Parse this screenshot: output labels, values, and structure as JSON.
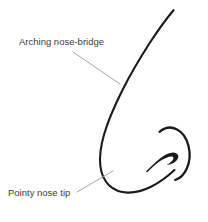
{
  "figure": {
    "name": "nose-profile-diagram",
    "background_color": "#ffffff",
    "ink_color": "#1a1a1a",
    "leader_color": "#9a9a9a",
    "text_color": "#3d3d3d",
    "width": 208,
    "height": 222
  },
  "annotations": [
    {
      "id": "arching-nose-bridge",
      "label": "Arching nose-bridge",
      "text_x": 19,
      "text_y": 45,
      "leader": {
        "x1": 73,
        "y1": 52,
        "x2": 120,
        "y2": 84
      }
    },
    {
      "id": "pointy-nose-tip",
      "label": "Pointy nose tip",
      "text_x": 8,
      "text_y": 196,
      "leader": {
        "x1": 77,
        "y1": 192,
        "x2": 113,
        "y2": 171
      }
    }
  ],
  "drawing": {
    "parts": [
      {
        "id": "nose-outline",
        "name": "nose-bridge-and-tip-outline",
        "stroke_width": 2.1,
        "path": "M173.5,10.2 C166.5,18.5 158.5,29.5 150.0,42.5 C141.0,56.5 131.0,73.0 122.5,90.0 C114.5,106.0 108.0,121.0 104.2,134.0 C100.6,146.5 99.4,157.0 100.3,165.5 C101.2,174.0 104.2,180.5 109.0,185.2 C114.0,190.0 120.5,192.4 127.8,192.6 C135.5,192.8 143.5,190.6 151.0,186.8 C159.5,182.5 167.5,176.5 174.5,170.0"
      },
      {
        "id": "alar-wing",
        "name": "nostril-wing-arc",
        "stroke_width": 2.3,
        "path": "M159.6,131.8 C164.5,127.6 171.0,126.4 176.6,129.2 C182.6,132.2 186.8,138.6 188.6,146.2 C190.4,153.8 189.8,161.8 186.8,168.4 C184.2,174.2 180.0,178.4 175.2,180.0"
      },
      {
        "id": "nostril-crease",
        "name": "nostril-crease-stroke",
        "stroke_width": 1.5,
        "path": "M147.0,171.5 C152.5,166.0 157.5,161.0 162.5,157.6 C167.0,154.6 171.0,153.2 174.2,153.6"
      },
      {
        "id": "nostril-opening",
        "name": "nostril-opening-shape",
        "fill_path": "M151.8,167.2 C156.6,161.6 162.0,157.0 167.0,154.6 C171.4,152.5 175.2,152.2 177.2,154.0 C179.0,155.6 178.6,158.2 176.6,160.4 C174.4,162.8 170.6,164.6 166.8,165.0 C169.6,163.4 172.0,161.4 173.0,159.6 C173.9,158.0 173.4,156.8 171.8,156.6 C169.6,156.3 166.0,157.6 162.2,159.8 C158.4,162.0 154.7,164.8 151.8,167.2 Z"
      }
    ]
  }
}
